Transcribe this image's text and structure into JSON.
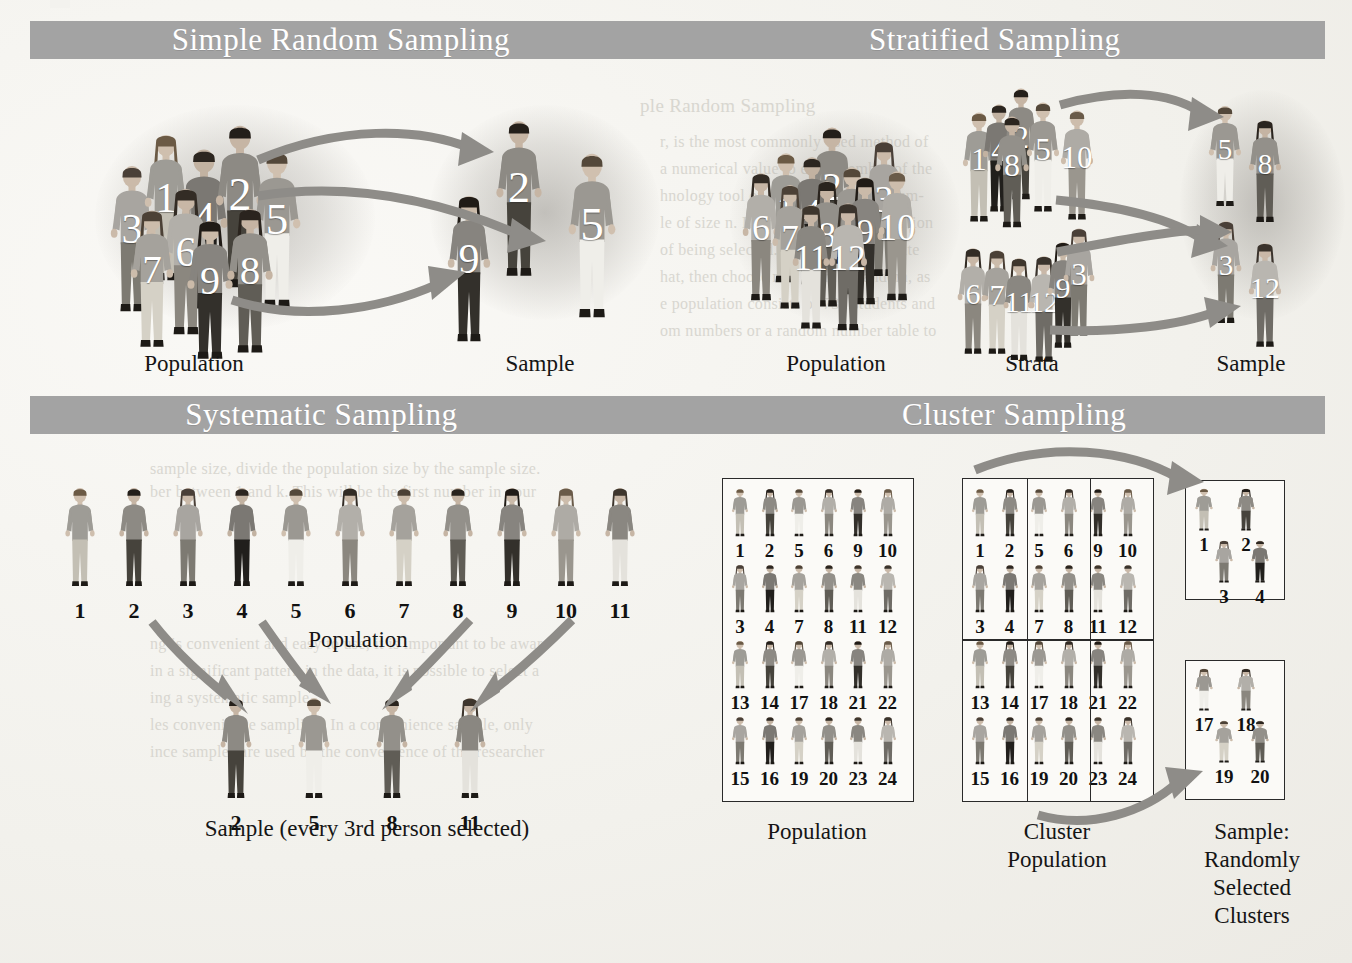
{
  "figure": {
    "banner_color": "#a3a3a3",
    "banner_text_color": "#ffffff",
    "arrow_color": "#8e8c88",
    "page_background": "#f3f2ee"
  },
  "panels": {
    "simple_random": {
      "title": "Simple Random Sampling",
      "population_label": "Population",
      "sample_label": "Sample",
      "population": [
        1,
        2,
        3,
        4,
        5,
        6,
        7,
        8,
        9
      ],
      "sample": [
        2,
        9,
        5
      ]
    },
    "stratified": {
      "title": "Stratified Sampling",
      "population_label": "Population",
      "strata_label": "Strata",
      "sample_label": "Sample",
      "population": [
        1,
        2,
        3,
        4,
        5,
        6,
        7,
        8,
        9,
        10,
        11,
        12
      ],
      "strata": [
        {
          "name": "stratum-1",
          "members": [
            1,
            4,
            2,
            8,
            5,
            10
          ]
        },
        {
          "name": "stratum-2",
          "members": [
            6,
            7,
            11,
            12,
            9,
            3
          ]
        }
      ],
      "sample": [
        {
          "from_stratum": "stratum-1",
          "members": [
            5,
            8
          ]
        },
        {
          "from_stratum": "stratum-2",
          "members": [
            3,
            12
          ]
        }
      ]
    },
    "systematic": {
      "title": "Systematic Sampling",
      "population_label": "Population",
      "sample_label": "Sample (every 3rd person selected)",
      "population": [
        1,
        2,
        3,
        4,
        5,
        6,
        7,
        8,
        9,
        10,
        11
      ],
      "sample": [
        2,
        5,
        8,
        11
      ],
      "interval": 3
    },
    "cluster": {
      "title": "Cluster Sampling",
      "population_label": "Population",
      "cluster_population_label": "Cluster\nPopulation",
      "sample_label": "Sample:\nRandomly\nSelected\nClusters",
      "population_rows": [
        [
          1,
          2,
          5,
          6,
          9,
          10
        ],
        [
          3,
          4,
          7,
          8,
          11,
          12
        ],
        [
          13,
          14,
          17,
          18,
          21,
          22
        ],
        [
          15,
          16,
          19,
          20,
          23,
          24
        ]
      ],
      "clusters": [
        {
          "id": 1,
          "members": [
            1,
            2,
            3,
            4
          ]
        },
        {
          "id": 2,
          "members": [
            5,
            6,
            7,
            8
          ]
        },
        {
          "id": 3,
          "members": [
            9,
            10,
            11,
            12
          ]
        },
        {
          "id": 4,
          "members": [
            13,
            14,
            15,
            16
          ]
        },
        {
          "id": 5,
          "members": [
            17,
            18,
            19,
            20
          ]
        },
        {
          "id": 6,
          "members": [
            21,
            22,
            23,
            24
          ]
        }
      ],
      "selected_clusters": [
        {
          "id": 1,
          "members": [
            1,
            2,
            3,
            4
          ]
        },
        {
          "id": 5,
          "members": [
            17,
            18,
            19,
            20
          ]
        }
      ]
    }
  },
  "background_bleed": {
    "lines_top": [
      "ple Random Sampling",
      "r, is the most commonly used method of",
      "a numerical value to each member of the",
      "hnology tool or a table of random num-",
      "le of size n. Each value in the population",
      "of being selected. You also could write",
      "hat, then choose n of them at random, as",
      "e population consists of 731 students and",
      "om numbers or a random number table to"
    ],
    "lines_mid": [
      "sample size, divide the population size by the sample size.",
      "ber between 1 and k. This will be the first number in your"
    ],
    "lines_low": [
      "ng is convenient and easy to use, it is important to be aware",
      "in a significant pattern in the data, it is possible to select a",
      "ing a systematic sample.",
      "les convenience sampling. In a convenience sample, only",
      "ince samples are used by the convenience of the researcher"
    ]
  }
}
